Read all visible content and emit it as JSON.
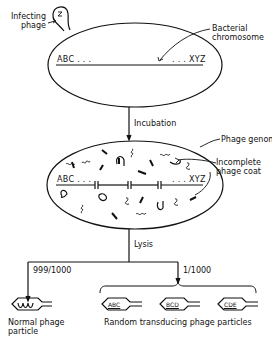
{
  "diagram": {
    "stages": [
      {
        "id": "infection",
        "labels": {
          "infecting_phage_line1": "Infecting",
          "infecting_phage_line2": "phage",
          "bacterial_chromosome_line1": "Bacterial",
          "bacterial_chromosome_line2": "chromosome"
        },
        "chromosome_start": "ABC . . .",
        "chromosome_end": ". . . XYZ"
      },
      {
        "id": "incubation",
        "arrow_label": "Incubation"
      },
      {
        "id": "fragmented",
        "labels": {
          "phage_genome": "Phage genome",
          "incomplete_coat_line1": "Incomplete",
          "incomplete_coat_line2": "phage coat"
        },
        "chromosome_start": "ABC . . .",
        "chromosome_end": ". . . XYZ"
      },
      {
        "id": "lysis",
        "arrow_label": "Lysis"
      }
    ],
    "outcomes": [
      {
        "ratio": "999/1000",
        "label_line1": "Normal phage",
        "label_line2": "particle",
        "content": "phage DNA"
      },
      {
        "ratio": "1/1000",
        "label": "Random transducing phage particles",
        "particles": [
          "ABC",
          "BCD",
          "CDE"
        ]
      }
    ]
  }
}
